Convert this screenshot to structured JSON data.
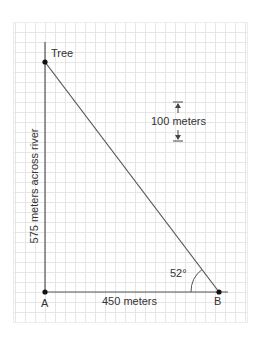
{
  "diagram": {
    "labels": {
      "tree": "Tree",
      "point_a": "A",
      "point_b": "B",
      "vertical_side": "575 meters across river",
      "horizontal_side": "450 meters",
      "angle": "52°",
      "scale": "100 meters"
    },
    "colors": {
      "grid": "#e4e4e4",
      "line": "#555555",
      "point": "#111111",
      "text": "#333333"
    }
  }
}
